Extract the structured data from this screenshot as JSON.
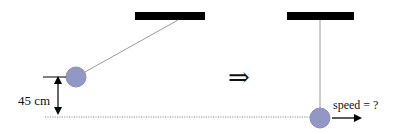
{
  "diagram": {
    "colors": {
      "ceiling": "#000000",
      "string": "#9a9a9a",
      "bob_fill": "#9297c4",
      "bob_stroke": "#8a8fbd",
      "dotted_line": "#8a8a8a",
      "text": "#111111"
    },
    "initial_state": {
      "ceiling": {
        "x": 135,
        "y": 12,
        "w": 70,
        "h": 8
      },
      "string": {
        "x1": 178,
        "y1": 20,
        "x2": 85,
        "y2": 72
      },
      "bob": {
        "cx": 76,
        "cy": 77,
        "r": 10
      }
    },
    "height_marker": {
      "label": "45 cm",
      "tick_y": 77,
      "tick_x1": 43,
      "tick_x2": 66,
      "arrow_x": 58,
      "arrow_y1": 78,
      "arrow_y2": 117
    },
    "reference_line": {
      "x1": 45,
      "x2": 312,
      "y": 117
    },
    "transition_symbol": "⇒",
    "final_state": {
      "ceiling": {
        "x": 287,
        "y": 12,
        "w": 67,
        "h": 8
      },
      "string": {
        "x": 320,
        "y1": 20,
        "y2": 108
      },
      "bob": {
        "cx": 320,
        "cy": 118,
        "r": 10
      },
      "velocity_label": "speed = ?",
      "velocity_arrow": {
        "x1": 332,
        "x2": 360,
        "y": 118
      }
    }
  }
}
